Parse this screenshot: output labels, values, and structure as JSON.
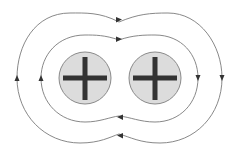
{
  "diagram": {
    "colors": {
      "background": "#ffffff",
      "field_line": "#7a7a7a",
      "arrow": "#333333",
      "charge_fill": "#dcdcdc",
      "charge_stroke": "#8a8a8a",
      "plus_sign": "#333333"
    },
    "charges": [
      {
        "id": "left",
        "sign": "+",
        "label": "positive charge",
        "cx": 85,
        "cy": 78,
        "r": 26
      },
      {
        "id": "right",
        "sign": "+",
        "label": "positive charge",
        "cx": 155,
        "cy": 78,
        "r": 26
      }
    ],
    "field_lines": [
      {
        "id": "inner",
        "label": "inner field line",
        "direction": "clockwise"
      },
      {
        "id": "outer",
        "label": "outer field line",
        "direction": "clockwise"
      }
    ],
    "arrows": [
      {
        "line": "outer",
        "position": "top",
        "points": "right"
      },
      {
        "line": "inner",
        "position": "top",
        "points": "right"
      },
      {
        "line": "outer",
        "position": "left",
        "points": "up"
      },
      {
        "line": "inner",
        "position": "left",
        "points": "up"
      },
      {
        "line": "inner",
        "position": "right",
        "points": "down"
      },
      {
        "line": "outer",
        "position": "right",
        "points": "down"
      },
      {
        "line": "inner",
        "position": "bottom",
        "points": "left"
      },
      {
        "line": "outer",
        "position": "bottom",
        "points": "left"
      }
    ]
  }
}
